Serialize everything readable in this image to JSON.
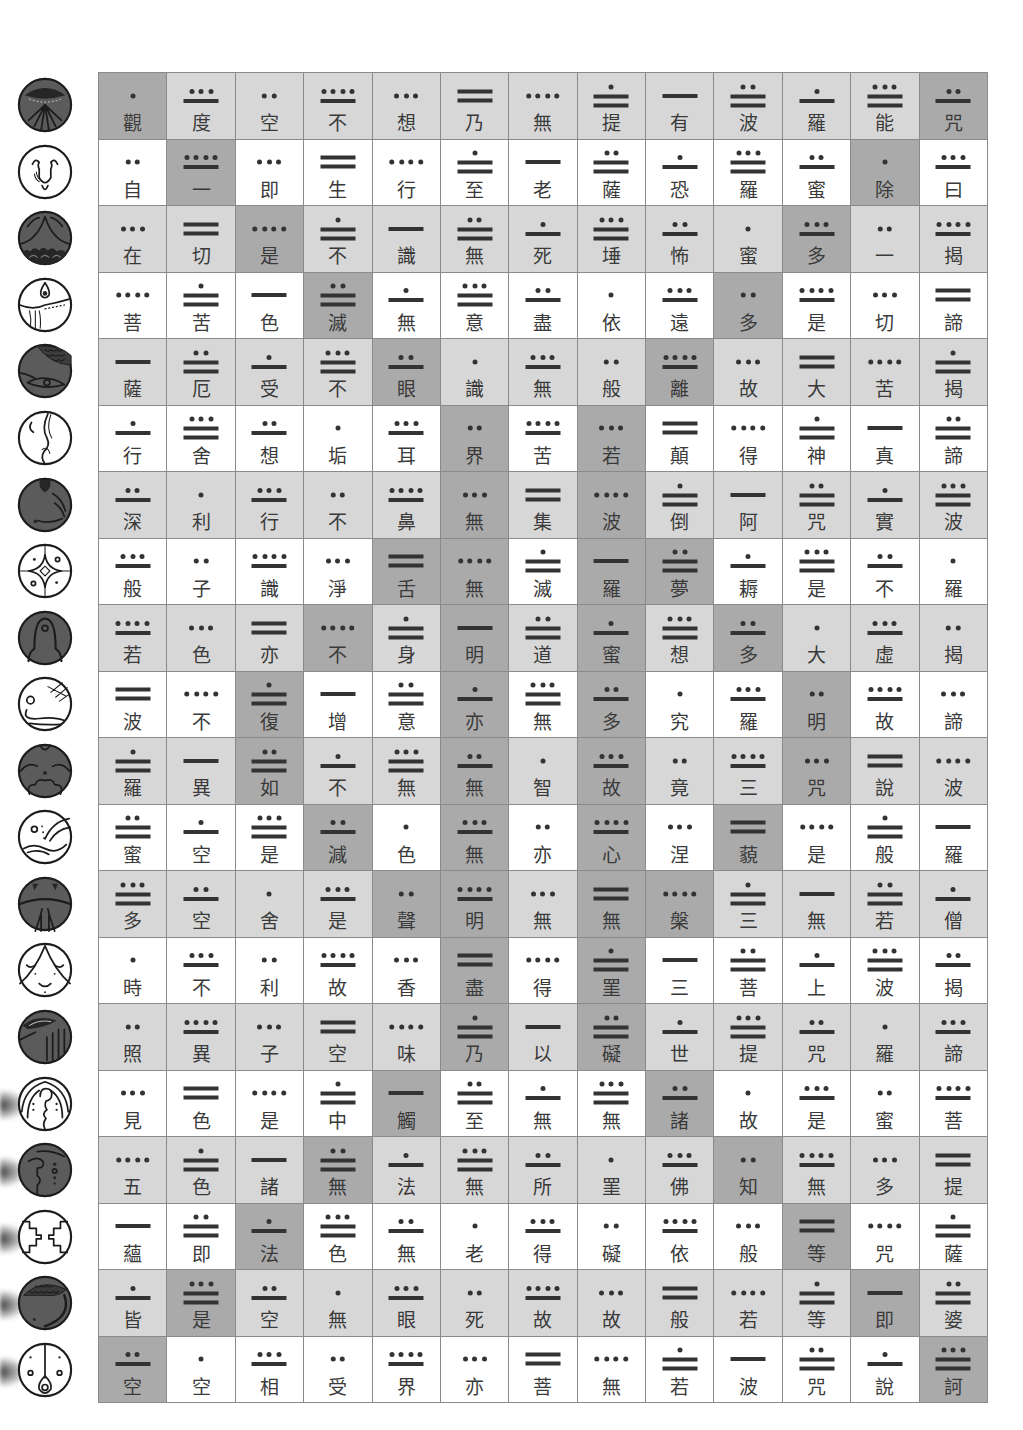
{
  "colors": {
    "row_shaded": "#d7d7d7",
    "row_plain": "#ffffff",
    "highlight": "#aaaaaa",
    "grid_line": "#8a8a8a",
    "character": "#3a3a3a",
    "numeral": "#333333",
    "glyph_dark": "#5b5b5b"
  },
  "day_signs": [
    {
      "icon": "imix-day-sign-icon",
      "style": "dark"
    },
    {
      "icon": "ik-day-sign-icon",
      "style": "light"
    },
    {
      "icon": "akbal-day-sign-icon",
      "style": "dark"
    },
    {
      "icon": "kan-day-sign-icon",
      "style": "light"
    },
    {
      "icon": "chicchan-day-sign-icon",
      "style": "dark"
    },
    {
      "icon": "cimi-day-sign-icon",
      "style": "light"
    },
    {
      "icon": "manik-day-sign-icon",
      "style": "dark"
    },
    {
      "icon": "lamat-day-sign-icon",
      "style": "light"
    },
    {
      "icon": "muluc-day-sign-icon",
      "style": "dark"
    },
    {
      "icon": "oc-day-sign-icon",
      "style": "light"
    },
    {
      "icon": "chuen-day-sign-icon",
      "style": "dark"
    },
    {
      "icon": "eb-day-sign-icon",
      "style": "light"
    },
    {
      "icon": "ben-day-sign-icon",
      "style": "dark"
    },
    {
      "icon": "ix-day-sign-icon",
      "style": "light"
    },
    {
      "icon": "men-day-sign-icon",
      "style": "dark"
    },
    {
      "icon": "cib-day-sign-icon",
      "style": "light"
    },
    {
      "icon": "caban-day-sign-icon",
      "style": "dark"
    },
    {
      "icon": "etznab-day-sign-icon",
      "style": "light"
    },
    {
      "icon": "cauac-day-sign-icon",
      "style": "dark"
    },
    {
      "icon": "ahau-day-sign-icon",
      "style": "light"
    }
  ],
  "grid": {
    "columns": 13,
    "row_count": 20,
    "rows": [
      {
        "chars": [
          "觀",
          "度",
          "空",
          "不",
          "想",
          "乃",
          "無",
          "提",
          "有",
          "波",
          "羅",
          "能",
          "咒"
        ],
        "numbers": [
          1,
          8,
          2,
          9,
          3,
          10,
          4,
          11,
          5,
          12,
          6,
          13,
          7
        ],
        "highlights": [
          1,
          13
        ]
      },
      {
        "chars": [
          "自",
          "一",
          "即",
          "生",
          "行",
          "至",
          "老",
          "薩",
          "恐",
          "羅",
          "蜜",
          "除",
          "曰"
        ],
        "numbers": [
          2,
          9,
          3,
          10,
          4,
          11,
          5,
          12,
          6,
          13,
          7,
          1,
          8
        ],
        "highlights": [
          2,
          12
        ]
      },
      {
        "chars": [
          "在",
          "切",
          "是",
          "不",
          "識",
          "無",
          "死",
          "埵",
          "怖",
          "蜜",
          "多",
          "一",
          "揭"
        ],
        "numbers": [
          3,
          10,
          4,
          11,
          5,
          12,
          6,
          13,
          7,
          1,
          8,
          2,
          9
        ],
        "highlights": [
          3,
          11
        ]
      },
      {
        "chars": [
          "菩",
          "苦",
          "色",
          "滅",
          "無",
          "意",
          "盡",
          "依",
          "遠",
          "多",
          "是",
          "切",
          "諦"
        ],
        "numbers": [
          4,
          11,
          5,
          12,
          6,
          13,
          7,
          1,
          8,
          2,
          9,
          3,
          10
        ],
        "highlights": [
          4,
          10
        ]
      },
      {
        "chars": [
          "薩",
          "厄",
          "受",
          "不",
          "眼",
          "識",
          "無",
          "般",
          "離",
          "故",
          "大",
          "苦",
          "揭"
        ],
        "numbers": [
          5,
          12,
          6,
          13,
          7,
          1,
          8,
          2,
          9,
          3,
          10,
          4,
          11
        ],
        "highlights": [
          5,
          9
        ]
      },
      {
        "chars": [
          "行",
          "舍",
          "想",
          "垢",
          "耳",
          "界",
          "苦",
          "若",
          "顛",
          "得",
          "神",
          "真",
          "諦"
        ],
        "numbers": [
          6,
          13,
          7,
          1,
          8,
          2,
          9,
          3,
          10,
          4,
          11,
          5,
          12
        ],
        "highlights": [
          6,
          8
        ]
      },
      {
        "chars": [
          "深",
          "利",
          "行",
          "不",
          "鼻",
          "無",
          "集",
          "波",
          "倒",
          "阿",
          "咒",
          "實",
          "波"
        ],
        "numbers": [
          7,
          1,
          8,
          2,
          9,
          3,
          10,
          4,
          11,
          5,
          12,
          6,
          13
        ],
        "highlights": [
          6,
          8
        ]
      },
      {
        "chars": [
          "般",
          "子",
          "識",
          "淨",
          "舌",
          "無",
          "滅",
          "羅",
          "夢",
          "耨",
          "是",
          "不",
          "羅"
        ],
        "numbers": [
          8,
          2,
          9,
          3,
          10,
          4,
          11,
          5,
          12,
          6,
          13,
          7,
          1
        ],
        "highlights": [
          5,
          6,
          8,
          9
        ]
      },
      {
        "chars": [
          "若",
          "色",
          "亦",
          "不",
          "身",
          "明",
          "道",
          "蜜",
          "想",
          "多",
          "大",
          "虛",
          "揭"
        ],
        "numbers": [
          9,
          3,
          10,
          4,
          11,
          5,
          12,
          6,
          13,
          7,
          1,
          8,
          2
        ],
        "highlights": [
          4,
          6,
          8,
          10
        ]
      },
      {
        "chars": [
          "波",
          "不",
          "復",
          "增",
          "意",
          "亦",
          "無",
          "多",
          "究",
          "羅",
          "明",
          "故",
          "諦"
        ],
        "numbers": [
          10,
          4,
          11,
          5,
          12,
          6,
          13,
          7,
          1,
          8,
          2,
          9,
          3
        ],
        "highlights": [
          3,
          6,
          8,
          11
        ]
      },
      {
        "chars": [
          "羅",
          "異",
          "如",
          "不",
          "無",
          "無",
          "智",
          "故",
          "竟",
          "三",
          "咒",
          "說",
          "波"
        ],
        "numbers": [
          11,
          5,
          12,
          6,
          13,
          7,
          1,
          8,
          2,
          9,
          3,
          10,
          4
        ],
        "highlights": [
          3,
          6,
          8,
          11
        ]
      },
      {
        "chars": [
          "蜜",
          "空",
          "是",
          "減",
          "色",
          "無",
          "亦",
          "心",
          "涅",
          "藐",
          "是",
          "般",
          "羅"
        ],
        "numbers": [
          12,
          6,
          13,
          7,
          1,
          8,
          2,
          9,
          3,
          10,
          4,
          11,
          5
        ],
        "highlights": [
          4,
          6,
          8,
          10
        ]
      },
      {
        "chars": [
          "多",
          "空",
          "舍",
          "是",
          "聲",
          "明",
          "無",
          "無",
          "槃",
          "三",
          "無",
          "若",
          "僧"
        ],
        "numbers": [
          13,
          7,
          1,
          8,
          2,
          9,
          3,
          10,
          4,
          11,
          5,
          12,
          6
        ],
        "highlights": [
          5,
          6,
          8,
          9
        ]
      },
      {
        "chars": [
          "時",
          "不",
          "利",
          "故",
          "香",
          "盡",
          "得",
          "罣",
          "三",
          "菩",
          "上",
          "波",
          "揭"
        ],
        "numbers": [
          1,
          8,
          2,
          9,
          3,
          10,
          4,
          11,
          5,
          12,
          6,
          13,
          7
        ],
        "highlights": [
          6,
          8
        ]
      },
      {
        "chars": [
          "照",
          "異",
          "子",
          "空",
          "味",
          "乃",
          "以",
          "礙",
          "世",
          "提",
          "咒",
          "羅",
          "諦"
        ],
        "numbers": [
          2,
          9,
          3,
          10,
          4,
          11,
          5,
          12,
          6,
          13,
          7,
          1,
          8
        ],
        "highlights": [
          6,
          8
        ]
      },
      {
        "chars": [
          "見",
          "色",
          "是",
          "中",
          "觸",
          "至",
          "無",
          "無",
          "諸",
          "故",
          "是",
          "蜜",
          "菩"
        ],
        "numbers": [
          3,
          10,
          4,
          11,
          5,
          12,
          6,
          13,
          7,
          1,
          8,
          2,
          9
        ],
        "highlights": [
          5,
          9
        ]
      },
      {
        "chars": [
          "五",
          "色",
          "諸",
          "無",
          "法",
          "無",
          "所",
          "罣",
          "佛",
          "知",
          "無",
          "多",
          "提"
        ],
        "numbers": [
          4,
          11,
          5,
          12,
          6,
          13,
          7,
          1,
          8,
          2,
          9,
          3,
          10
        ],
        "highlights": [
          4,
          10
        ]
      },
      {
        "chars": [
          "蘊",
          "即",
          "法",
          "色",
          "無",
          "老",
          "得",
          "礙",
          "依",
          "般",
          "等",
          "咒",
          "薩"
        ],
        "numbers": [
          5,
          12,
          6,
          13,
          7,
          1,
          8,
          2,
          9,
          3,
          10,
          4,
          11
        ],
        "highlights": [
          3,
          11
        ]
      },
      {
        "chars": [
          "皆",
          "是",
          "空",
          "無",
          "眼",
          "死",
          "故",
          "故",
          "般",
          "若",
          "等",
          "即",
          "婆"
        ],
        "numbers": [
          6,
          13,
          7,
          1,
          8,
          2,
          9,
          3,
          10,
          4,
          11,
          5,
          12
        ],
        "highlights": [
          2,
          12
        ]
      },
      {
        "chars": [
          "空",
          "空",
          "相",
          "受",
          "界",
          "亦",
          "菩",
          "無",
          "若",
          "波",
          "咒",
          "說",
          "訶"
        ],
        "numbers": [
          7,
          1,
          8,
          2,
          9,
          3,
          10,
          4,
          11,
          5,
          12,
          6,
          13
        ],
        "highlights": [
          1,
          13
        ]
      }
    ]
  }
}
